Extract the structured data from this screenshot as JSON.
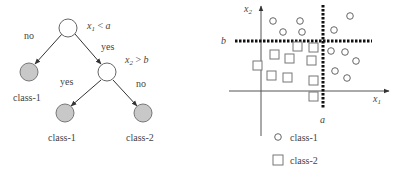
{
  "tree": {
    "root": {
      "condition_var": "x",
      "condition_sub": "1",
      "condition_op": " < ",
      "condition_val": "a"
    },
    "node2": {
      "condition_var": "x",
      "condition_sub": "2",
      "condition_op": " > ",
      "condition_val": "b"
    },
    "edges": {
      "root_no": "no",
      "root_yes": "yes",
      "node2_yes": "yes",
      "node2_no": "no"
    },
    "leaves": {
      "left": "class-1",
      "bottom_left": "class-1",
      "bottom_right": "class-2"
    }
  },
  "scatter": {
    "x_axis_var": "x",
    "x_axis_sub": "1",
    "y_axis_var": "x",
    "y_axis_sub": "2",
    "threshold_x": "a",
    "threshold_y": "b"
  },
  "legend": {
    "items": [
      {
        "shape": "circle",
        "label": "class-1"
      },
      {
        "shape": "square",
        "label": "class-2"
      }
    ]
  },
  "colors": {
    "leaf_fill": "#c8c8c8",
    "stroke": "#555555",
    "line": "#333333",
    "dash": "#111111"
  }
}
